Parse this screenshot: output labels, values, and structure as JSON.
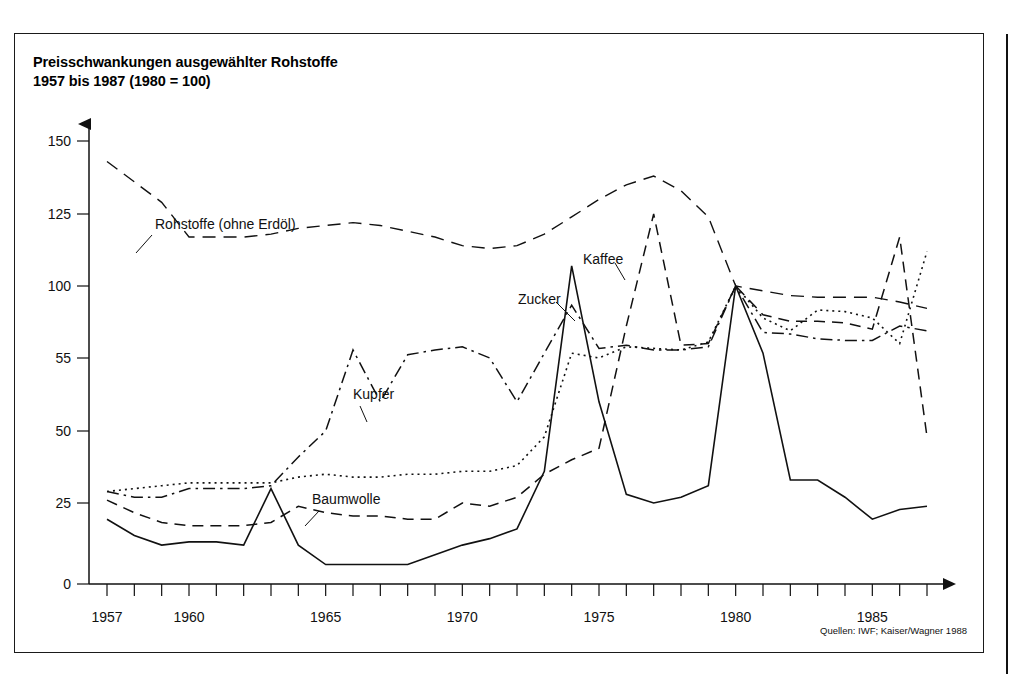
{
  "figure": {
    "title": "Preisschwankungen ausgewählter Rohstoffe\n1957 bis 1987 (1980 = 100)",
    "source_note": "Quellen: IWF; Kaiser/Wagner 1988"
  },
  "chart_data": {
    "type": "line",
    "title": "Preisschwankungen ausgewählter Rohstoffe 1957 bis 1987 (1980 = 100)",
    "subtitle": "1980 = 100",
    "xlabel": "",
    "ylabel": "",
    "grid": false,
    "legend": "inline-annotations",
    "xlim": [
      1957,
      1987
    ],
    "x_tick_labels": [
      "1957",
      "1960",
      "1965",
      "1970",
      "1975",
      "1980",
      "1985"
    ],
    "x_tick_values": [
      1957,
      1960,
      1965,
      1970,
      1975,
      1980,
      1985
    ],
    "x_minor_ticks_every_year": true,
    "y_tick_labels": [
      "0",
      "25",
      "50",
      "55",
      "100",
      "125",
      "150"
    ],
    "y_tick_values": [
      0,
      25,
      50,
      55,
      100,
      125,
      150
    ],
    "y_axis_note": "Tick labels as printed on the scanned original; spacing is uniform between printed labels.",
    "x": [
      1957,
      1958,
      1959,
      1960,
      1961,
      1962,
      1963,
      1964,
      1965,
      1966,
      1967,
      1968,
      1969,
      1970,
      1971,
      1972,
      1973,
      1974,
      1975,
      1976,
      1977,
      1978,
      1979,
      1980,
      1981,
      1982,
      1983,
      1984,
      1985,
      1986,
      1987
    ],
    "series": [
      {
        "name": "Rohstoffe (ohne Erdöl)",
        "line_style": "long-dash",
        "label_position": "upper-left",
        "values": [
          143,
          136,
          129,
          117,
          117,
          117,
          118,
          120,
          121,
          122,
          121,
          119,
          117,
          114,
          113,
          114,
          118,
          124,
          130,
          135,
          138,
          133,
          124,
          100,
          97,
          94,
          93,
          93,
          93,
          90,
          86
        ]
      },
      {
        "name": "Kaffee",
        "line_style": "dashed",
        "label_position": "upper-middle",
        "values": [
          26,
          22,
          19,
          18,
          18,
          18,
          19,
          24,
          22,
          21,
          21,
          20,
          20,
          25,
          24,
          27,
          35,
          40,
          44,
          75,
          125,
          63,
          64,
          100,
          82,
          78,
          78,
          77,
          73,
          117,
          48
        ]
      },
      {
        "name": "Kupfer",
        "line_style": "dash-dot",
        "label_position": "middle-left",
        "values": [
          29,
          27,
          27,
          30,
          30,
          30,
          31,
          41,
          50,
          60,
          52,
          57,
          60,
          62,
          55,
          52,
          58,
          88,
          61,
          63,
          60,
          60,
          62,
          100,
          71,
          70,
          67,
          66,
          66,
          75,
          72
        ]
      },
      {
        "name": "Baumwolle",
        "line_style": "dotted",
        "label_position": "lower-middle",
        "values": [
          29,
          30,
          31,
          32,
          32,
          32,
          32,
          34,
          35,
          34,
          34,
          35,
          35,
          36,
          36,
          38,
          48,
          58,
          55,
          62,
          61,
          60,
          65,
          100,
          80,
          72,
          85,
          84,
          80,
          64,
          112
        ]
      },
      {
        "name": "Zucker",
        "line_style": "solid",
        "label_position": "upper-middle",
        "values": [
          20,
          15,
          12,
          13,
          13,
          12,
          30,
          12,
          6,
          6,
          6,
          6,
          9,
          12,
          14,
          17,
          36,
          107,
          52,
          28,
          25,
          27,
          31,
          100,
          58,
          33,
          33,
          27,
          20,
          23,
          24
        ]
      }
    ]
  },
  "annotations": [
    {
      "text": "Rohstoffe (ohne Erdöl)",
      "x": 140,
      "y": 195
    },
    {
      "text": "Kupfer",
      "x": 338,
      "y": 365
    },
    {
      "text": "Baumwolle",
      "x": 297,
      "y": 470
    },
    {
      "text": "Zucker",
      "x": 503,
      "y": 270
    },
    {
      "text": "Kaffee",
      "x": 568,
      "y": 230
    }
  ]
}
